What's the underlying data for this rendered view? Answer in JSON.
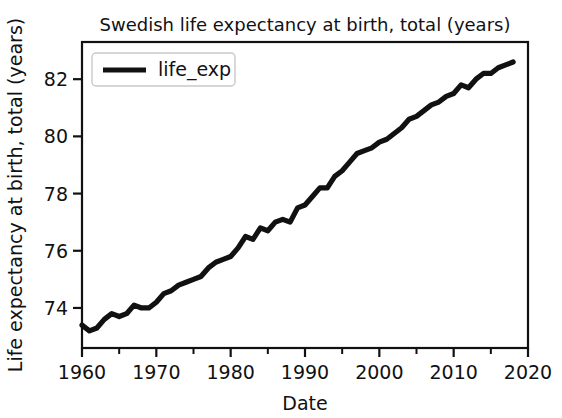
{
  "chart_data": {
    "type": "line",
    "title": "Swedish life expectancy at birth, total (years)",
    "xlabel": "Date",
    "ylabel": "Life expectancy at birth, total (years)",
    "xlim": [
      1960,
      2020
    ],
    "ylim": [
      72.6,
      83.3
    ],
    "grid": false,
    "legend_position": "upper left",
    "xticks": [
      1960,
      1970,
      1980,
      1990,
      2000,
      2010,
      2020
    ],
    "xtick_labels": [
      "1960",
      "1970",
      "1980",
      "1990",
      "2000",
      "2010",
      "2020"
    ],
    "xminor_ticks": [
      1965,
      1975,
      1985,
      1995,
      2005,
      2015
    ],
    "yticks": [
      74,
      76,
      78,
      80,
      82
    ],
    "ytick_labels": [
      "74",
      "76",
      "78",
      "80",
      "82"
    ],
    "series": [
      {
        "name": "life_exp",
        "color": "#111111",
        "x": [
          1960,
          1961,
          1962,
          1963,
          1964,
          1965,
          1966,
          1967,
          1968,
          1969,
          1970,
          1971,
          1972,
          1973,
          1974,
          1975,
          1976,
          1977,
          1978,
          1979,
          1980,
          1981,
          1982,
          1983,
          1984,
          1985,
          1986,
          1987,
          1988,
          1989,
          1990,
          1991,
          1992,
          1993,
          1994,
          1995,
          1996,
          1997,
          1998,
          1999,
          2000,
          2001,
          2002,
          2003,
          2004,
          2005,
          2006,
          2007,
          2008,
          2009,
          2010,
          2011,
          2012,
          2013,
          2014,
          2015,
          2016,
          2017,
          2018
        ],
        "values": [
          73.4,
          73.2,
          73.3,
          73.6,
          73.8,
          73.7,
          73.8,
          74.1,
          74.0,
          74.0,
          74.2,
          74.5,
          74.6,
          74.8,
          74.9,
          75.0,
          75.1,
          75.4,
          75.6,
          75.7,
          75.8,
          76.1,
          76.5,
          76.4,
          76.8,
          76.7,
          77.0,
          77.1,
          77.0,
          77.5,
          77.6,
          77.9,
          78.2,
          78.2,
          78.6,
          78.8,
          79.1,
          79.4,
          79.5,
          79.6,
          79.8,
          79.9,
          80.1,
          80.3,
          80.6,
          80.7,
          80.9,
          81.1,
          81.2,
          81.4,
          81.5,
          81.8,
          81.7,
          82.0,
          82.2,
          82.2,
          82.4,
          82.5,
          82.6
        ]
      }
    ]
  },
  "legend": {
    "entries": [
      {
        "label": "life_exp"
      }
    ]
  }
}
